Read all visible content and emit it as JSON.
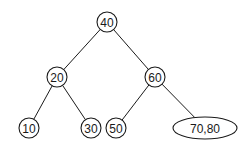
{
  "diagram": {
    "type": "tree",
    "nodes": [
      {
        "id": "n40",
        "label": "40",
        "shape": "circle",
        "cx": 107,
        "cy": 22,
        "r": 10
      },
      {
        "id": "n20",
        "label": "20",
        "shape": "circle",
        "cx": 57,
        "cy": 77,
        "r": 10
      },
      {
        "id": "n60",
        "label": "60",
        "shape": "circle",
        "cx": 155,
        "cy": 77,
        "r": 10
      },
      {
        "id": "n10",
        "label": "10",
        "shape": "circle",
        "cx": 29,
        "cy": 128,
        "r": 10
      },
      {
        "id": "n30",
        "label": "30",
        "shape": "circle",
        "cx": 91,
        "cy": 128,
        "r": 10
      },
      {
        "id": "n50",
        "label": "50",
        "shape": "circle",
        "cx": 116,
        "cy": 128,
        "r": 10
      },
      {
        "id": "n7080",
        "label": "70,80",
        "shape": "ellipse",
        "cx": 205,
        "cy": 128,
        "rx": 32,
        "ry": 11
      }
    ],
    "edges": [
      {
        "from": "n40",
        "to": "n20"
      },
      {
        "from": "n40",
        "to": "n60"
      },
      {
        "from": "n20",
        "to": "n10"
      },
      {
        "from": "n20",
        "to": "n30"
      },
      {
        "from": "n60",
        "to": "n50"
      },
      {
        "from": "n60",
        "to": "n7080"
      }
    ],
    "colors": {
      "stroke": "#1a1a1a",
      "fill": "#ffffff",
      "text": "#1a1a1a"
    }
  }
}
